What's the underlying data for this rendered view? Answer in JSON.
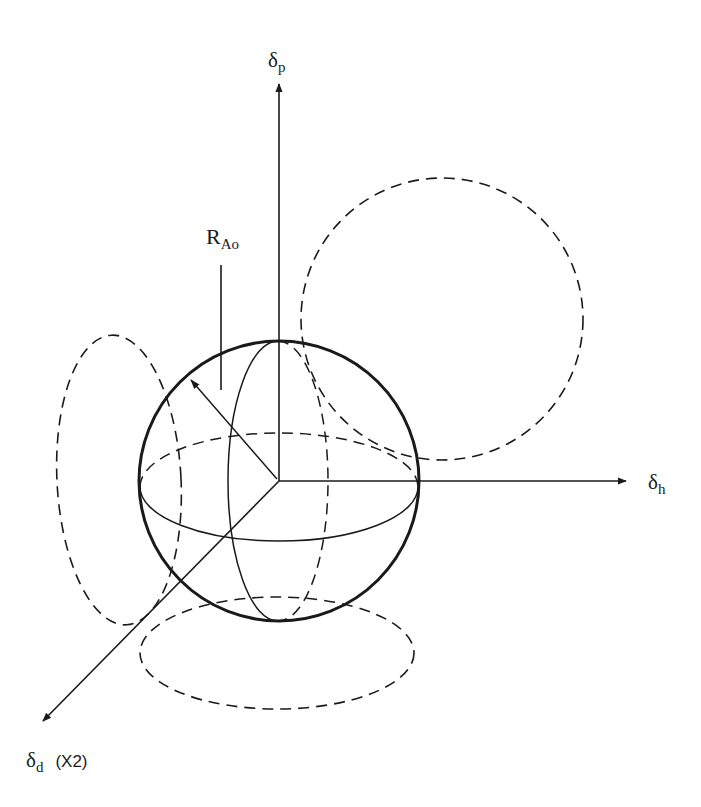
{
  "figure": {
    "type": "Hansen solubility sphere diagram",
    "colors": {
      "ink": "#1a1a1a",
      "background": "#ffffff"
    },
    "labels": {
      "delta_p": {
        "symbol": "δ",
        "sub": "p"
      },
      "delta_h": {
        "symbol": "δ",
        "sub": "h"
      },
      "delta_d": {
        "symbol": "δ",
        "sub": "d",
        "suffix": "(X2)"
      },
      "radius": {
        "symbol": "R",
        "sub": "Ao"
      }
    },
    "geometry": {
      "origin": [
        279,
        481
      ],
      "sphere": {
        "cx": 279,
        "cy": 481,
        "r": 140
      },
      "equator": {
        "cx": 279,
        "cy": 487,
        "rx": 139,
        "ry": 54
      },
      "meridian": {
        "cx": 278,
        "cy": 481,
        "rx": 50,
        "ry": 140
      },
      "projection_top_right": {
        "cx": 442,
        "cy": 319,
        "r": 141
      },
      "projection_left": {
        "cx": 119,
        "cy": 480,
        "rx": 62,
        "ry": 145
      },
      "projection_bottom": {
        "cx": 277,
        "cy": 653,
        "rx": 137,
        "ry": 56
      },
      "axis_p_tip": [
        279,
        82
      ],
      "axis_h_tip": [
        628,
        481
      ],
      "axis_d_tip": [
        41,
        723
      ],
      "radius_arrow_tip": [
        190,
        378
      ],
      "radius_leader": {
        "x": 221,
        "y1": 265,
        "y2": 390
      }
    }
  }
}
